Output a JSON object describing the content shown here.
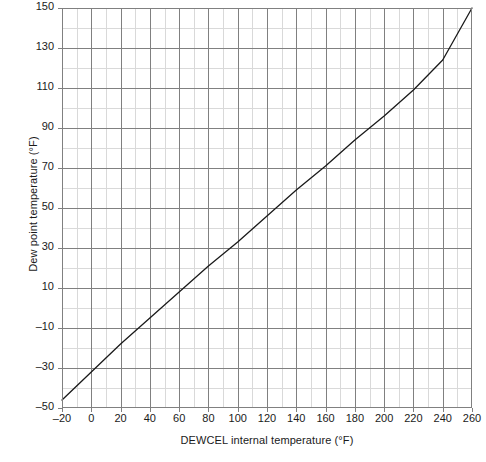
{
  "chart_data": {
    "type": "line",
    "title": "",
    "xlabel": "DEWCEL internal temperature (°F)",
    "ylabel": "Dew point temperature (°F)",
    "xlim": [
      -20,
      260
    ],
    "ylim": [
      -50,
      150
    ],
    "xticks": [
      -20,
      0,
      20,
      40,
      60,
      80,
      100,
      120,
      140,
      160,
      180,
      200,
      220,
      240,
      260
    ],
    "yticks": [
      -50,
      -30,
      -10,
      10,
      30,
      50,
      70,
      90,
      110,
      130,
      150
    ],
    "xtick_labels": [
      "–20",
      "0",
      "20",
      "40",
      "60",
      "80",
      "100",
      "120",
      "140",
      "160",
      "180",
      "200",
      "220",
      "240",
      "260"
    ],
    "ytick_labels": [
      "–50",
      "–30",
      "–10",
      "10",
      "30",
      "50",
      "70",
      "90",
      "110",
      "130",
      "150"
    ],
    "x_minor_step": 10,
    "y_minor_step": 10,
    "grid": true,
    "legend": "none",
    "series": [
      {
        "name": "DEWCEL calibration curve",
        "x": [
          -20,
          0,
          20,
          40,
          60,
          80,
          100,
          120,
          140,
          160,
          180,
          200,
          220,
          240,
          260
        ],
        "y": [
          -46,
          -32,
          -18,
          -5,
          8,
          21,
          33,
          46,
          59,
          71,
          84,
          96,
          109,
          124,
          150
        ],
        "color": "#1a1a1a",
        "linewidth": 1.3
      }
    ],
    "colors": {
      "line": "#1a1a1a",
      "major_grid": "#808080",
      "minor_grid": "#d9d9d9",
      "frame": "#808080",
      "text": "#1a1a1a",
      "background": "#ffffff"
    }
  }
}
